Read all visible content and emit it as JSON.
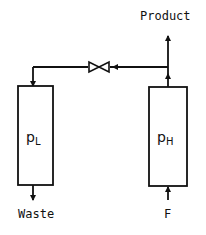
{
  "diagram": {
    "type": "process-flow",
    "stroke_color": "#111111",
    "background": "#ffffff",
    "labels": {
      "product": "Product",
      "waste": "Waste",
      "feed": "F"
    },
    "columns": [
      {
        "id": "low-pressure-column",
        "symbol": "p",
        "subscript": "L"
      },
      {
        "id": "high-pressure-column",
        "symbol": "p",
        "subscript": "H"
      }
    ],
    "connections": [
      {
        "from": "feed",
        "to": "high-pressure-column"
      },
      {
        "from": "high-pressure-column",
        "to": "product"
      },
      {
        "from": "high-pressure-column",
        "to": "valve"
      },
      {
        "from": "valve",
        "to": "low-pressure-column"
      },
      {
        "from": "low-pressure-column",
        "to": "waste"
      }
    ],
    "valve": {
      "icon": "valve-icon"
    }
  }
}
